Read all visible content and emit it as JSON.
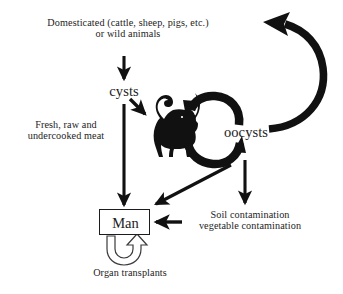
{
  "figure": {
    "kind": "transmission-cycle-diagram",
    "background_color": "#ffffff",
    "ink_color": "#1c1c1c"
  },
  "labels": {
    "animals_line1": "Domesticated (cattle, sheep, pigs, etc.)",
    "animals_line2": "or wild animals",
    "animals_full": "Domesticated (cattle, sheep, pigs, etc.)\nor wild animals",
    "cysts": "cysts",
    "meat": "Fresh, raw and\nundercooked meat",
    "oocysts": "oocysts",
    "man": "Man",
    "soil": "Soil contamination\nvegetable contamination",
    "organ_transplants": "Organ transplants"
  },
  "nodes": [
    {
      "id": "animals",
      "label": "Domesticated (cattle, sheep, pigs, etc.) or wild animals",
      "boxed": false
    },
    {
      "id": "cysts",
      "label": "cysts",
      "boxed": false
    },
    {
      "id": "oocysts",
      "label": "oocysts",
      "boxed": false
    },
    {
      "id": "man",
      "label": "Man",
      "boxed": true
    },
    {
      "id": "soil",
      "label": "Soil contamination vegetable contamination",
      "boxed": false
    },
    {
      "id": "cat",
      "label": "cat-silhouette",
      "boxed": false
    }
  ],
  "edges": [
    {
      "id": "animals-to-cysts",
      "from": "animals",
      "to": "cysts",
      "style": "straight-down",
      "label": ""
    },
    {
      "id": "cysts-to-man",
      "from": "cysts",
      "to": "man",
      "style": "long-straight-down",
      "label": "Fresh, raw and undercooked meat"
    },
    {
      "id": "cysts-to-cat",
      "from": "cysts",
      "to": "cat",
      "style": "short-diagonal",
      "label": ""
    },
    {
      "id": "cat-to-oocysts",
      "from": "cat",
      "to": "oocysts",
      "style": "curved-cycle-lower",
      "label": ""
    },
    {
      "id": "oocysts-to-cat",
      "from": "oocysts",
      "to": "cat",
      "style": "curved-cycle-upper",
      "label": ""
    },
    {
      "id": "oocysts-to-animals",
      "from": "oocysts",
      "to": "animals",
      "style": "large-sweeping-curve",
      "label": ""
    },
    {
      "id": "oocysts-to-man",
      "from": "oocysts",
      "to": "man",
      "style": "diagonal-down-left",
      "label": ""
    },
    {
      "id": "oocysts-to-soil",
      "from": "oocysts",
      "to": "soil",
      "style": "straight-down",
      "label": ""
    },
    {
      "id": "soil-to-man",
      "from": "soil",
      "to": "man",
      "style": "horizontal-left",
      "label": ""
    },
    {
      "id": "man-to-man",
      "from": "man",
      "to": "man",
      "style": "hollow-loop-below",
      "label": "Organ transplants"
    }
  ]
}
